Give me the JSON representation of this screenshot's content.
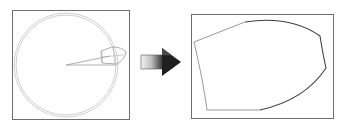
{
  "diagram": {
    "left_panel": {
      "label": "",
      "contents": [
        "double-circle",
        "sector-lines",
        "bullet-shaped-region"
      ]
    },
    "arrow": {
      "direction": "right",
      "style": "gradient-3d"
    },
    "right_panel": {
      "label": "",
      "contents": [
        "unwrapped-region-outline"
      ]
    },
    "colors": {
      "frame": "#6e6e6e",
      "circle": "#c8c8c8",
      "shape_light": "#a0a0a0",
      "shape_dark": "#404040",
      "arrow_dark": "#1a1a1a",
      "arrow_light": "#f0f0f0"
    }
  }
}
